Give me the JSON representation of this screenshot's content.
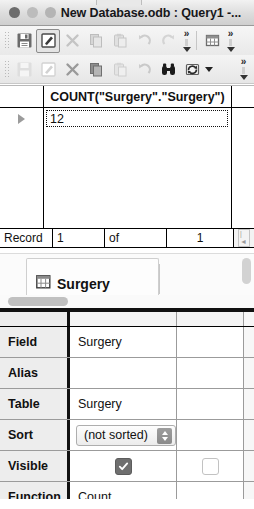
{
  "window": {
    "title": "New Database.odb : Query1 -...",
    "traffic_lights": [
      "close",
      "minimize",
      "zoom"
    ]
  },
  "toolbar_primary": {
    "buttons": [
      {
        "name": "save-button",
        "icon": "save-icon",
        "state": "enabled"
      },
      {
        "name": "edit-button",
        "icon": "edit-icon",
        "state": "active"
      },
      {
        "name": "cut-button",
        "icon": "cut-icon",
        "state": "disabled"
      },
      {
        "name": "copy-button",
        "icon": "copy-icon",
        "state": "disabled"
      },
      {
        "name": "paste-button",
        "icon": "paste-icon",
        "state": "disabled"
      },
      {
        "name": "undo-button",
        "icon": "undo-icon",
        "state": "disabled"
      },
      {
        "name": "redo-button",
        "icon": "redo-icon",
        "state": "disabled"
      }
    ],
    "overflow_label": "»",
    "extra_button": {
      "name": "table-view-button",
      "icon": "table-icon"
    }
  },
  "toolbar_secondary": {
    "buttons": [
      {
        "name": "save-record-button",
        "icon": "save-icon",
        "state": "disabled"
      },
      {
        "name": "edit-record-button",
        "icon": "edit-icon",
        "state": "disabled"
      },
      {
        "name": "delete-record-button",
        "icon": "cut-icon",
        "state": "disabled"
      },
      {
        "name": "copy-record-button",
        "icon": "copy-icon",
        "state": "enabled"
      },
      {
        "name": "paste-record-button",
        "icon": "paste-icon",
        "state": "disabled"
      },
      {
        "name": "refresh-button",
        "icon": "undo-icon",
        "state": "disabled"
      },
      {
        "name": "find-record-button",
        "icon": "binoculars-icon",
        "state": "enabled"
      },
      {
        "name": "refresh-data-button",
        "icon": "refresh-icon",
        "state": "enabled"
      }
    ],
    "overflow_label": "»"
  },
  "result_grid": {
    "column_header": "COUNT(\"Surgery\".\"Surgery\")",
    "rows": [
      {
        "selected": true,
        "value": "12"
      }
    ]
  },
  "record_bar": {
    "label": "Record",
    "current": "1",
    "of_label": "of",
    "total": "1"
  },
  "table_panel": {
    "table_name": "Surgery",
    "icon": "table-icon"
  },
  "design_grid": {
    "rows": [
      {
        "label": "Field",
        "col1": "Surgery",
        "type": "text",
        "col2": ""
      },
      {
        "label": "Alias",
        "col1": "",
        "type": "text",
        "col2": ""
      },
      {
        "label": "Table",
        "col1": "Surgery",
        "type": "text",
        "col2": ""
      },
      {
        "label": "Sort",
        "col1": "(not sorted)",
        "type": "combo",
        "col2": ""
      },
      {
        "label": "Visible",
        "col1": "checked",
        "type": "checkbox",
        "col2": "unchecked"
      },
      {
        "label": "Function",
        "col1": "Count",
        "type": "text",
        "col2": ""
      }
    ]
  },
  "colors": {
    "titlebar_top": "#f2f2f2",
    "titlebar_bottom": "#cfcfcf",
    "grid_border": "#000000",
    "label_bg": "#ededed",
    "checkbox_on": "#6f6f6f",
    "scrollbar_thumb": "#c0c0c0"
  }
}
